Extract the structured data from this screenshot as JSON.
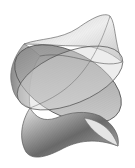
{
  "image": {
    "subject": "ruled mathematical surface rendering (string-art style)",
    "width": 135,
    "height": 168,
    "background": "#ffffff",
    "colors": {
      "line": "#555555",
      "shade_dark": "#5a5a5a",
      "shade_mid": "#9a9a9a",
      "shade_light": "#e6e6e6"
    }
  }
}
